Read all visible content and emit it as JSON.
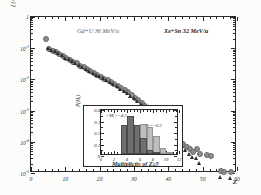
{
  "figure": {
    "annotation_left": "Gd+U 36 MeV/u",
    "annotation_right": "Xe+Sn 32 MeV/u"
  },
  "chart_data": {
    "type": "scatter",
    "title": "",
    "xlabel": "Z",
    "ylabel": "(1/Mⱼ) dM/dZ",
    "xlim": [
      0,
      60
    ],
    "ylim_log": [
      1e-05,
      1
    ],
    "xticks": [
      0,
      10,
      20,
      30,
      40,
      50,
      60
    ],
    "yticks": [
      "1",
      "10-1",
      "10-2",
      "10-3",
      "10-4",
      "10-5"
    ],
    "ytick_labels": [
      "1",
      "10",
      "10",
      "10",
      "10",
      "10"
    ],
    "ytick_exponents": [
      "",
      "-1",
      "-2",
      "-3",
      "-4",
      "-5"
    ],
    "grid": false,
    "legend": "none",
    "series": [
      {
        "name": "Gd+U 36 MeV/u",
        "marker": "circle",
        "color": "#8d8d8d",
        "points": [
          [
            4,
            0.22
          ],
          [
            5,
            0.105
          ],
          [
            6,
            0.088
          ],
          [
            7,
            0.082
          ],
          [
            8,
            0.07
          ],
          [
            9,
            0.062
          ],
          [
            10,
            0.052
          ],
          [
            11,
            0.046
          ],
          [
            12,
            0.04
          ],
          [
            13,
            0.035
          ],
          [
            14,
            0.03
          ],
          [
            15,
            0.026
          ],
          [
            16,
            0.023
          ],
          [
            17,
            0.02
          ],
          [
            18,
            0.017
          ],
          [
            19,
            0.0152
          ],
          [
            20,
            0.0132
          ],
          [
            21,
            0.0115
          ],
          [
            22,
            0.01
          ],
          [
            23,
            0.0088
          ],
          [
            24,
            0.0076
          ],
          [
            25,
            0.0065
          ],
          [
            26,
            0.0056
          ],
          [
            27,
            0.0048
          ],
          [
            28,
            0.0041
          ],
          [
            29,
            0.0034
          ],
          [
            30,
            0.0028
          ],
          [
            31,
            0.0023
          ],
          [
            32,
            0.0019
          ],
          [
            33,
            0.00155
          ],
          [
            34,
            0.00125
          ],
          [
            35,
            0.001
          ],
          [
            36,
            0.0008
          ],
          [
            37,
            0.00062
          ],
          [
            38,
            0.00048
          ],
          [
            39,
            0.00037
          ],
          [
            40,
            0.00028
          ],
          [
            41,
            0.00021
          ],
          [
            42,
            0.00016
          ],
          [
            43,
            0.00012
          ],
          [
            44,
            9.2e-05
          ],
          [
            45,
            7.6e-05
          ],
          [
            46,
            6.2e-05
          ],
          [
            47,
            5e-05
          ],
          [
            48,
            6.2e-05
          ],
          [
            49,
            4.4e-05
          ],
          [
            51,
            4e-05
          ],
          [
            52,
            3.8e-05
          ],
          [
            55,
            1.25e-05
          ],
          [
            56,
            1.2e-05
          ],
          [
            58,
            1.15e-05
          ]
        ]
      },
      {
        "name": "Xe+Sn 32 MeV/u",
        "marker": "triangle",
        "color": "#2e2e2e",
        "points": [
          [
            5,
            0.1
          ],
          [
            6,
            0.086
          ],
          [
            7,
            0.08
          ],
          [
            8,
            0.068
          ],
          [
            9,
            0.06
          ],
          [
            10,
            0.05
          ],
          [
            11,
            0.044
          ],
          [
            12,
            0.038
          ],
          [
            13,
            0.033
          ],
          [
            14,
            0.0285
          ],
          [
            15,
            0.0248
          ],
          [
            16,
            0.0218
          ],
          [
            17,
            0.019
          ],
          [
            18,
            0.0162
          ],
          [
            19,
            0.0143
          ],
          [
            20,
            0.0124
          ],
          [
            21,
            0.0108
          ],
          [
            22,
            0.0094
          ],
          [
            23,
            0.0082
          ],
          [
            24,
            0.007
          ],
          [
            25,
            0.006
          ],
          [
            26,
            0.0051
          ],
          [
            27,
            0.0043
          ],
          [
            28,
            0.0036
          ],
          [
            29,
            0.003
          ],
          [
            30,
            0.0025
          ],
          [
            31,
            0.002
          ],
          [
            32,
            0.00165
          ],
          [
            33,
            0.00134
          ],
          [
            34,
            0.00108
          ],
          [
            35,
            0.00086
          ],
          [
            36,
            0.00068
          ],
          [
            37,
            0.00052
          ],
          [
            38,
            0.0004
          ],
          [
            39,
            0.0003
          ],
          [
            40,
            0.00023
          ],
          [
            41,
            0.000175
          ],
          [
            42,
            0.00013
          ],
          [
            43,
            9.8e-05
          ],
          [
            44,
            7.4e-05
          ],
          [
            45,
            5.6e-05
          ],
          [
            46,
            4.2e-05
          ],
          [
            47,
            3.2e-05
          ],
          [
            48,
            3e-05
          ],
          [
            49,
            2.15e-05
          ],
          [
            55,
            7.2e-06
          ],
          [
            58,
            7e-06
          ]
        ]
      }
    ]
  },
  "inset": {
    "chart_data": {
      "type": "bar",
      "xlabel": "Multiplicity of Z≥5",
      "ylabel": "P(Mⱼ)",
      "xlim": [
        0,
        12
      ],
      "ylim": [
        0,
        0.4
      ],
      "xticks": [
        0,
        2,
        4,
        6,
        8,
        10,
        12
      ],
      "yticks": [
        "0",
        "0.1",
        "0.2",
        "0.3",
        "0.4"
      ],
      "grid": false,
      "annotation_a": "<Mⱼ>=4.3",
      "annotation_b": "<Mⱼ>=6.3",
      "series": [
        {
          "name": "<Mⱼ>=4.3",
          "color": "#6f6f6f",
          "bins": [
            3,
            4,
            5,
            6,
            7,
            8
          ],
          "values": [
            0.25,
            0.33,
            0.25,
            0.14,
            0.035,
            0.012
          ]
        },
        {
          "name": "<Mⱼ>=6.3",
          "color": "#b9b9b9",
          "bins": [
            5,
            6,
            7,
            8,
            9,
            10
          ],
          "values": [
            0.165,
            0.26,
            0.235,
            0.155,
            0.055,
            0.018
          ]
        }
      ]
    }
  }
}
